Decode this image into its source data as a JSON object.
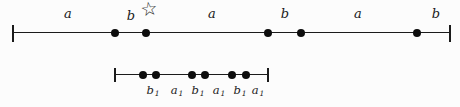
{
  "figure": {
    "ink_color": "#1b1b1b",
    "dot_color": "#0d0d0d",
    "background_color": "#fcfcfc",
    "star": {
      "glyph": "☆",
      "x": 149,
      "y": 9
    },
    "top_line": {
      "y": 33,
      "x_start": 13,
      "x_end": 450,
      "end_tick_height": 17,
      "points_x": [
        115,
        146,
        268,
        301,
        417
      ],
      "labels": [
        {
          "text": "a",
          "x": 68,
          "y": 13
        },
        {
          "text": "b",
          "x": 131,
          "y": 15
        },
        {
          "text": "a",
          "x": 212,
          "y": 13
        },
        {
          "text": "b",
          "x": 285,
          "y": 13
        },
        {
          "text": "a",
          "x": 358,
          "y": 13
        },
        {
          "text": "b",
          "x": 436,
          "y": 13
        }
      ]
    },
    "bottom_line": {
      "y": 75,
      "x_start": 115,
      "x_end": 268,
      "end_tick_height": 14,
      "points_x": [
        143,
        156,
        192,
        205,
        232,
        246
      ],
      "labels": [
        {
          "base": "b",
          "sub": "1",
          "x": 153,
          "y": 91
        },
        {
          "base": "a",
          "sub": "1",
          "x": 177,
          "y": 91
        },
        {
          "base": "b",
          "sub": "1",
          "x": 198,
          "y": 91
        },
        {
          "base": "a",
          "sub": "1",
          "x": 219,
          "y": 91
        },
        {
          "base": "b",
          "sub": "1",
          "x": 240,
          "y": 91
        },
        {
          "base": "a",
          "sub": "1",
          "x": 258,
          "y": 91
        }
      ]
    }
  }
}
